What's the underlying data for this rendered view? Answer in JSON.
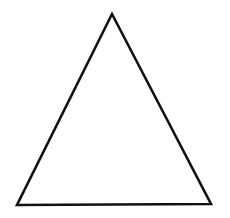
{
  "diagram": {
    "shape": "triangle",
    "kind": "equilateral-outline",
    "background": "#ffffff",
    "stroke_color": "#111111",
    "fill_color": "#ffffff",
    "stroke_width": 2.6,
    "vertices": {
      "apex": [
        112,
        14
      ],
      "bottom_left": [
        17,
        205
      ],
      "bottom_right": [
        211,
        204
      ]
    }
  }
}
